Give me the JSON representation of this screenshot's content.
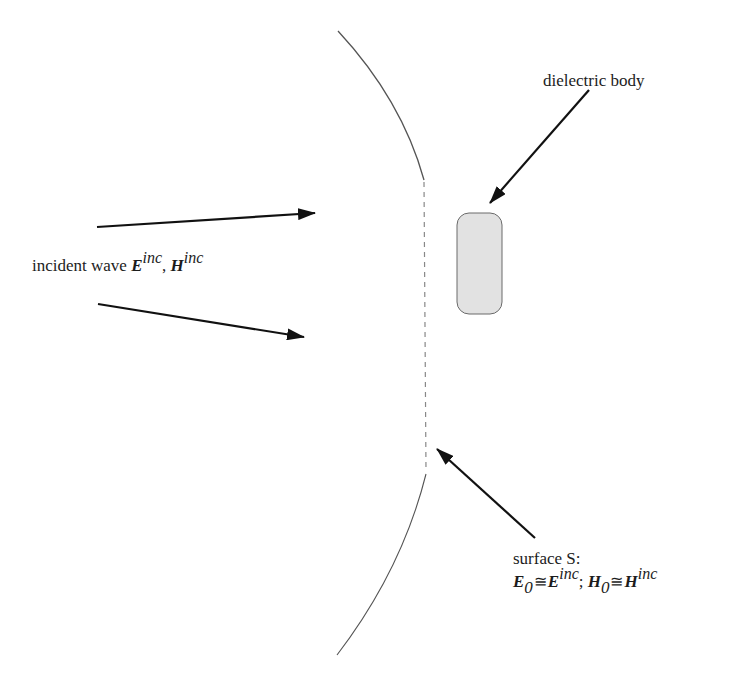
{
  "diagram": {
    "labels": {
      "dielectric_body": "dielectric body",
      "incident_wave": {
        "prefix": "incident wave ",
        "E": "E",
        "E_sup": "inc",
        "sep": ", ",
        "H": "H",
        "H_sup": "inc"
      },
      "surface": {
        "title": "surface S:",
        "E0": "E",
        "E0_sub": "0",
        "approx1": "≅",
        "Einc": "E",
        "Einc_sup": "inc",
        "semicolon": "; ",
        "H0": "H",
        "H0_sub": "0",
        "approx2": "≅",
        "Hinc": "H",
        "Hinc_sup": "inc"
      }
    },
    "elements": {
      "surface_arc": "surface S (curved boundary with dashed flat portion)",
      "dielectric_body_shape": "rounded rectangle, light gray",
      "incident_arrows": 2,
      "pointer_arrows": 2
    },
    "colors": {
      "arc": "#555555",
      "dashed": "#888888",
      "arrow": "#111111",
      "body_fill": "#e2e2e2",
      "body_stroke": "#6a6a6a"
    }
  }
}
